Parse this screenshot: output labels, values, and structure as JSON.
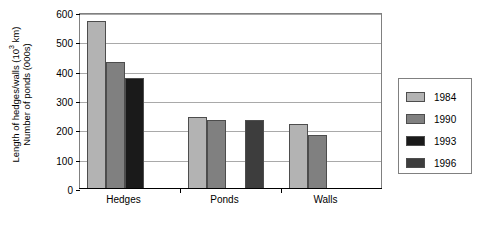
{
  "chart_data": {
    "type": "bar",
    "title": "",
    "xlabel": "",
    "ylabel": "Length of hedges/walls (10^3 km) / Number of ponds (000s)",
    "ylabel_line1_pre": "Length of hedges/walls (10",
    "ylabel_line1_sup": "3",
    "ylabel_line1_post": " km)",
    "ylabel_line2": "Number of ponds (000s)",
    "categories": [
      "Hedges",
      "Ponds",
      "Walls"
    ],
    "ylim": [
      0,
      600
    ],
    "yticks": [
      0,
      100,
      200,
      300,
      400,
      500,
      600
    ],
    "ytick_labels": [
      "0",
      "100",
      "200",
      "300",
      "400",
      "500",
      "600"
    ],
    "grid": true,
    "legend_position": "right-outside",
    "series": [
      {
        "name": "1984",
        "color": "#b3b3b3",
        "values": [
          570,
          242,
          218
        ]
      },
      {
        "name": "1990",
        "color": "#808080",
        "values": [
          430,
          232,
          180
        ]
      },
      {
        "name": "1993",
        "color": "#1a1a1a",
        "values": [
          375,
          null,
          null
        ]
      },
      {
        "name": "1996",
        "color": "#3d3d3d",
        "values": [
          null,
          231,
          null
        ]
      }
    ]
  },
  "legend": {
    "entries": [
      {
        "label": "1984"
      },
      {
        "label": "1990"
      },
      {
        "label": "1993"
      },
      {
        "label": "1996"
      }
    ]
  }
}
